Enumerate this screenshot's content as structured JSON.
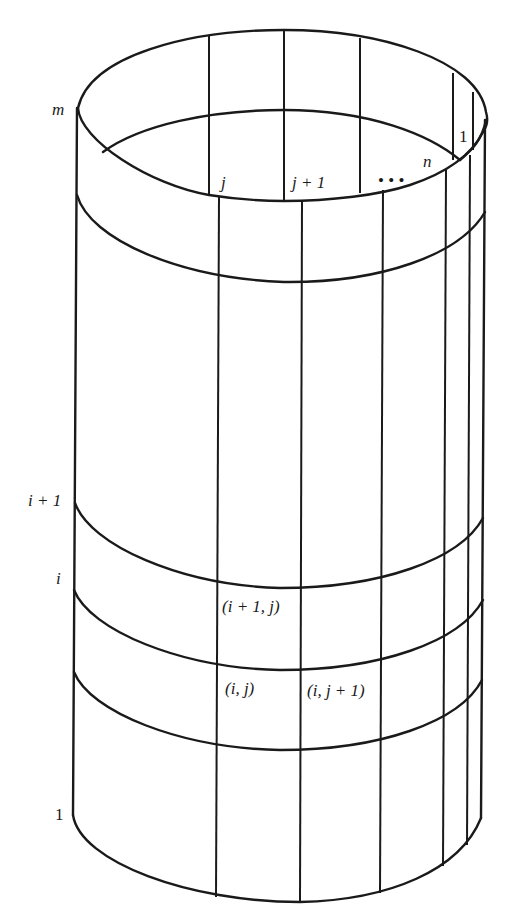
{
  "diagram": {
    "type": "cylindrical-grid",
    "row_labels": {
      "top": "m",
      "upper": "i + 1",
      "lower": "i",
      "bottom": "1"
    },
    "column_labels": {
      "j": "j",
      "j_plus_1": "j + 1",
      "ellipsis": "• • •",
      "n": "n",
      "first": "1"
    },
    "cell_labels": {
      "upper_cell": "(i + 1, j)",
      "lower_left_cell": "(i, j)",
      "lower_right_cell": "(i, j + 1)"
    },
    "colors": {
      "line": "#1a1a1a",
      "background": "#ffffff"
    }
  }
}
